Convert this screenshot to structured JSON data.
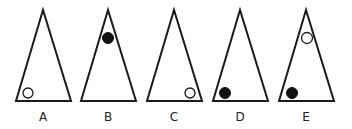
{
  "figure": {
    "colors": {
      "stroke": "#1a1a1a",
      "filled_dot": "#111111",
      "background": "#ffffff"
    },
    "options": [
      {
        "label": "A",
        "circles": [
          {
            "position": "bottom-left",
            "style": "open"
          }
        ]
      },
      {
        "label": "B",
        "circles": [
          {
            "position": "top",
            "style": "filled"
          }
        ]
      },
      {
        "label": "C",
        "circles": [
          {
            "position": "bottom-right",
            "style": "open"
          }
        ]
      },
      {
        "label": "D",
        "circles": [
          {
            "position": "bottom-left",
            "style": "filled"
          }
        ]
      },
      {
        "label": "E",
        "circles": [
          {
            "position": "top",
            "style": "open"
          },
          {
            "position": "bottom-left",
            "style": "filled"
          }
        ]
      }
    ]
  }
}
